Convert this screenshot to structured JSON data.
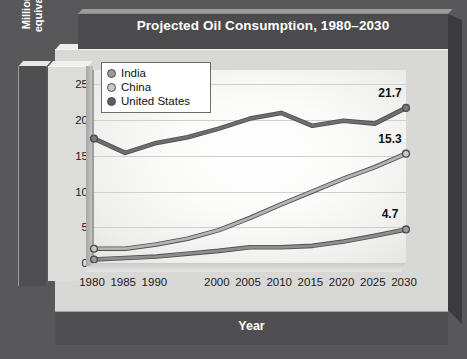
{
  "chart_data": {
    "type": "line",
    "title": "Projected Oil Consumption, 1980–2030",
    "xlabel": "Year",
    "ylabel": "Million barrels oil\nequivalent per day",
    "x": [
      1980,
      1985,
      1990,
      1995,
      2000,
      2005,
      2010,
      2015,
      2020,
      2025,
      2030
    ],
    "tick_labels_x": [
      "1980",
      "1985",
      "1990",
      "2000",
      "2005",
      "2010",
      "2015",
      "2020",
      "2025",
      "2030"
    ],
    "tick_values_x": [
      1980,
      1985,
      1990,
      2000,
      2005,
      2010,
      2015,
      2020,
      2025,
      2030
    ],
    "tick_labels_y": [
      "0",
      "5",
      "10",
      "15",
      "20",
      "25"
    ],
    "tick_values_y": [
      0,
      5,
      10,
      15,
      20,
      25
    ],
    "ylim": [
      0,
      27
    ],
    "xlim": [
      1980,
      2030
    ],
    "grid": true,
    "legend_position": "top-left",
    "series": [
      {
        "name": "India",
        "color": "#8e8e8e",
        "marker_color": "#9a9a9a",
        "end_label": "4.7",
        "values": [
          0.5,
          0.7,
          0.9,
          1.3,
          1.7,
          2.2,
          2.2,
          2.4,
          3.0,
          3.8,
          4.7
        ]
      },
      {
        "name": "China",
        "color": "#b4b4b4",
        "marker_color": "#c8c8c8",
        "end_label": "15.3",
        "values": [
          2.0,
          2.0,
          2.6,
          3.4,
          4.6,
          6.3,
          8.2,
          10.0,
          11.8,
          13.4,
          15.3
        ]
      },
      {
        "name": "United States",
        "color": "#6e6e6e",
        "marker_color": "#7a7a7a",
        "end_label": "21.7",
        "values": [
          17.4,
          15.4,
          16.8,
          17.6,
          18.8,
          20.2,
          21.0,
          19.2,
          19.9,
          19.5,
          21.7
        ]
      }
    ]
  },
  "legend": {
    "items": [
      {
        "label": "India",
        "swatch": "#9a9a9a"
      },
      {
        "label": "China",
        "swatch": "#c8c8c8"
      },
      {
        "label": "United States",
        "swatch": "#5e5e5e"
      }
    ]
  },
  "colors": {
    "panel_dark": "#4f4f51",
    "panel_light": "#d8d8d6",
    "title_text": "#ffffff",
    "plot_background": "#ffffff",
    "gridline": "#cfcfcd"
  }
}
